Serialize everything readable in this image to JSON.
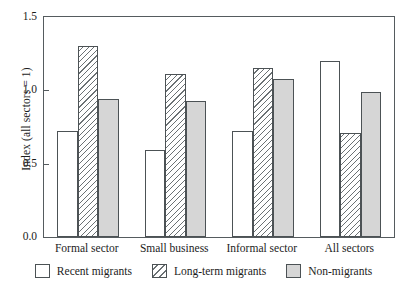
{
  "chart_data": {
    "type": "bar",
    "title": "",
    "subtitle": "",
    "xlabel": "",
    "ylabel": "Index (all sectors = 1)",
    "categories": [
      "Formal sector",
      "Small business",
      "Informal sector",
      "All sectors"
    ],
    "series": [
      {
        "name": "Recent migrants",
        "style": "white",
        "values": [
          0.72,
          0.59,
          0.72,
          1.2
        ]
      },
      {
        "name": "Long-term migrants",
        "style": "hatch",
        "values": [
          1.3,
          1.11,
          1.15,
          0.71
        ]
      },
      {
        "name": "Non-migrants",
        "style": "gray",
        "values": [
          0.94,
          0.93,
          1.08,
          0.99
        ]
      }
    ],
    "ylim": [
      0.0,
      1.5
    ],
    "yticks": [
      "0.0",
      "0.5",
      "1.0",
      "1.5"
    ],
    "ytick_values": [
      0.0,
      0.5,
      1.0,
      1.5
    ],
    "grid": false,
    "legend_position": "bottom",
    "colors": {
      "bar_outline": "#4c5255",
      "axis": "#555b5e",
      "gray_fill": "#d6d6d6",
      "white_fill": "#ffffff",
      "hatch_line": "#6b7174",
      "text": "#1c1c1c",
      "background": "#ffffff"
    }
  },
  "legend": {
    "items": [
      {
        "label": "Recent migrants",
        "style": "white"
      },
      {
        "label": "Long-term migrants",
        "style": "hatch"
      },
      {
        "label": "Non-migrants",
        "style": "gray"
      }
    ]
  }
}
